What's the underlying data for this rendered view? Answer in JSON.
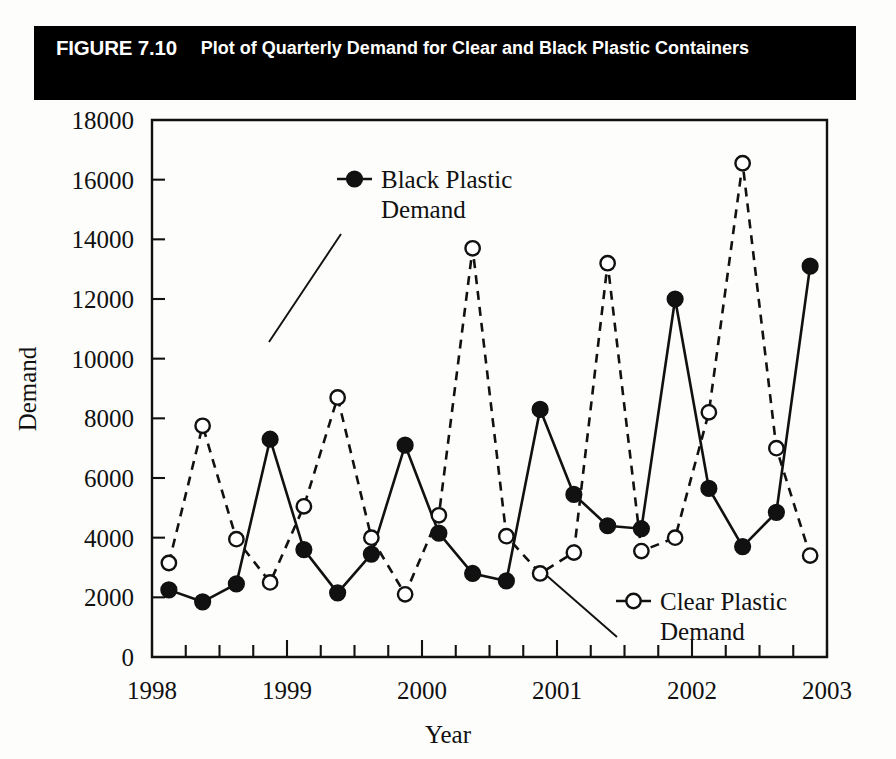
{
  "figure": {
    "number": "FIGURE 7.10",
    "title": "Plot of Quarterly Demand for Clear and Black Plastic Containers"
  },
  "chart_data": {
    "type": "line",
    "title": "Plot of Quarterly Demand for Clear and Black Plastic Containers",
    "xlabel": "Year",
    "ylabel": "Demand",
    "xlim": [
      1998,
      2003
    ],
    "ylim": [
      0,
      18000
    ],
    "ytick_step": 2000,
    "yticks": [
      0,
      2000,
      4000,
      6000,
      8000,
      10000,
      12000,
      14000,
      16000,
      18000
    ],
    "xticks": [
      1998,
      1999,
      2000,
      2001,
      2002,
      2003
    ],
    "x_minor_ticks_per_major": 4,
    "grid": false,
    "legend_position": "inside-plot",
    "x": [
      1998.125,
      1998.375,
      1998.625,
      1998.875,
      1999.125,
      1999.375,
      1999.625,
      1999.875,
      2000.125,
      2000.375,
      2000.625,
      2000.875,
      2001.125,
      2001.375,
      2001.625,
      2001.875,
      2002.125,
      2002.375,
      2002.625,
      2002.875
    ],
    "period_labels": [
      "1998 Q1",
      "1998 Q2",
      "1998 Q3",
      "1998 Q4",
      "1999 Q1",
      "1999 Q2",
      "1999 Q3",
      "1999 Q4",
      "2000 Q1",
      "2000 Q2",
      "2000 Q3",
      "2000 Q4",
      "2001 Q1",
      "2001 Q2",
      "2001 Q3",
      "2001 Q4",
      "2002 Q1",
      "2002 Q2",
      "2002 Q3",
      "2002 Q4"
    ],
    "series": [
      {
        "name": "Black Plastic Demand",
        "marker": "filled-circle",
        "line": "solid",
        "color": "#111111",
        "values": [
          2250,
          1850,
          2450,
          7300,
          3600,
          2150,
          3450,
          7100,
          4150,
          2800,
          2550,
          8300,
          5450,
          4400,
          4300,
          12000,
          5650,
          3700,
          4850,
          13100
        ]
      },
      {
        "name": "Clear Plastic Demand",
        "marker": "open-circle",
        "line": "dashed",
        "color": "#111111",
        "values": [
          3150,
          7750,
          3950,
          2500,
          5050,
          8700,
          4000,
          2100,
          4750,
          13700,
          4050,
          2800,
          3500,
          13200,
          3550,
          4000,
          8200,
          16550,
          7000,
          3400
        ]
      }
    ],
    "annotations": [
      {
        "label": "Black Plastic Demand",
        "marker": "filled-circle",
        "points_to": "1998 Q4 black point"
      },
      {
        "label": "Clear Plastic Demand",
        "marker": "open-circle",
        "points_to": "2000 Q4 clear point"
      }
    ]
  },
  "legend": {
    "black": {
      "line1": "Black Plastic",
      "line2": "Demand"
    },
    "clear": {
      "line1": "Clear Plastic",
      "line2": "Demand"
    }
  },
  "axes": {
    "y_title": "Demand",
    "x_title": "Year",
    "y_labels": [
      "18000",
      "16000",
      "14000",
      "12000",
      "10000",
      "8000",
      "6000",
      "4000",
      "2000",
      "0"
    ],
    "x_labels": [
      "1998",
      "1999",
      "2000",
      "2001",
      "2002",
      "2003"
    ]
  }
}
